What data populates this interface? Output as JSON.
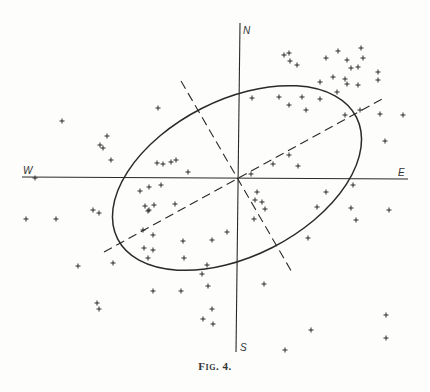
{
  "figure": {
    "caption": "Fig. 4.",
    "axis_labels": {
      "north": "N",
      "south": "S",
      "east": "E",
      "west": "W"
    },
    "colors": {
      "ink": "#2a2a2a",
      "background": "#fdfdfb"
    }
  },
  "chart_data": {
    "type": "scatter",
    "title": "Fig. 4.",
    "xlabel": "W — E",
    "ylabel": "S — N",
    "grid": false,
    "origin_px": [
      237,
      178
    ],
    "axes_px": {
      "horizontal": {
        "x1": 22,
        "y1": 177,
        "x2": 408,
        "y2": 179
      },
      "vertical": {
        "x1": 240,
        "y1": 23,
        "x2": 236,
        "y2": 352
      }
    },
    "ellipse_px": {
      "cx": 237,
      "cy": 178,
      "rx": 134,
      "ry": 78,
      "rotation_deg": -27
    },
    "major_axis_dashed_px": {
      "x1": 104,
      "y1": 252,
      "x2": 382,
      "y2": 99
    },
    "minor_axis_dashed_px": {
      "x1": 181,
      "y1": 81,
      "x2": 293,
      "y2": 274
    },
    "points_px": [
      [
        62,
        121
      ],
      [
        158,
        108
      ],
      [
        107,
        136
      ],
      [
        100,
        145
      ],
      [
        103,
        148
      ],
      [
        111,
        160
      ],
      [
        157,
        163
      ],
      [
        163,
        164
      ],
      [
        171,
        162
      ],
      [
        176,
        160
      ],
      [
        188,
        172
      ],
      [
        35,
        178
      ],
      [
        140,
        191
      ],
      [
        149,
        187
      ],
      [
        161,
        185
      ],
      [
        289,
        53
      ],
      [
        284,
        55
      ],
      [
        290,
        61
      ],
      [
        297,
        65
      ],
      [
        326,
        58
      ],
      [
        338,
        51
      ],
      [
        347,
        60
      ],
      [
        351,
        68
      ],
      [
        358,
        67
      ],
      [
        361,
        48
      ],
      [
        363,
        58
      ],
      [
        333,
        77
      ],
      [
        320,
        82
      ],
      [
        345,
        79
      ],
      [
        347,
        84
      ],
      [
        358,
        85
      ],
      [
        378,
        72
      ],
      [
        378,
        80
      ],
      [
        337,
        92
      ],
      [
        252,
        98
      ],
      [
        279,
        97
      ],
      [
        289,
        105
      ],
      [
        302,
        97
      ],
      [
        306,
        110
      ],
      [
        320,
        99
      ],
      [
        345,
        115
      ],
      [
        360,
        110
      ],
      [
        380,
        114
      ],
      [
        403,
        115
      ],
      [
        385,
        141
      ],
      [
        289,
        155
      ],
      [
        273,
        164
      ],
      [
        298,
        166
      ],
      [
        251,
        174
      ],
      [
        257,
        192
      ],
      [
        326,
        192
      ],
      [
        353,
        185
      ],
      [
        26,
        219
      ],
      [
        56,
        219
      ],
      [
        93,
        210
      ],
      [
        99,
        213
      ],
      [
        145,
        206
      ],
      [
        148,
        211
      ],
      [
        154,
        205
      ],
      [
        149,
        210
      ],
      [
        175,
        204
      ],
      [
        143,
        230
      ],
      [
        153,
        235
      ],
      [
        144,
        248
      ],
      [
        153,
        250
      ],
      [
        148,
        258
      ],
      [
        78,
        266
      ],
      [
        113,
        263
      ],
      [
        183,
        241
      ],
      [
        212,
        240
      ],
      [
        184,
        258
      ],
      [
        207,
        265
      ],
      [
        202,
        274
      ],
      [
        153,
        291
      ],
      [
        181,
        291
      ],
      [
        97,
        303
      ],
      [
        99,
        309
      ],
      [
        212,
        309
      ],
      [
        213,
        324
      ],
      [
        203,
        319
      ],
      [
        208,
        286
      ],
      [
        255,
        200
      ],
      [
        262,
        202
      ],
      [
        265,
        209
      ],
      [
        254,
        219
      ],
      [
        227,
        232
      ],
      [
        317,
        207
      ],
      [
        351,
        208
      ],
      [
        356,
        220
      ],
      [
        389,
        210
      ],
      [
        308,
        238
      ],
      [
        264,
        284
      ],
      [
        311,
        330
      ],
      [
        386,
        315
      ],
      [
        386,
        338
      ],
      [
        285,
        350
      ]
    ]
  }
}
